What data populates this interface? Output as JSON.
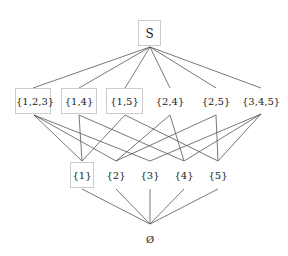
{
  "diagram": {
    "type": "hasse-diagram",
    "colors": {
      "edge": "#555555",
      "box_border": "#cccccc",
      "text": "#222222",
      "background": "#ffffff"
    },
    "top": {
      "id": "S",
      "label": "S",
      "boxed": true
    },
    "bottom": {
      "id": "empty",
      "label": "Ø",
      "boxed": false
    },
    "middle": [
      {
        "id": "123",
        "label": "{1,2,3}",
        "boxed": true
      },
      {
        "id": "14",
        "label": "{1,4}",
        "boxed": true
      },
      {
        "id": "15",
        "label": "{1,5}",
        "boxed": true
      },
      {
        "id": "24",
        "label": "{2,4}",
        "boxed": false
      },
      {
        "id": "25",
        "label": "{2,5}",
        "boxed": false
      },
      {
        "id": "345",
        "label": "{3,4,5}",
        "boxed": false
      }
    ],
    "singletons": [
      {
        "id": "1",
        "label": "{1}",
        "boxed": true
      },
      {
        "id": "2",
        "label": "{2}",
        "boxed": false
      },
      {
        "id": "3",
        "label": "{3}",
        "boxed": false
      },
      {
        "id": "4",
        "label": "{4}",
        "boxed": false
      },
      {
        "id": "5",
        "label": "{5}",
        "boxed": false
      }
    ],
    "edges": [
      [
        "S",
        "123"
      ],
      [
        "S",
        "14"
      ],
      [
        "S",
        "15"
      ],
      [
        "S",
        "24"
      ],
      [
        "S",
        "25"
      ],
      [
        "S",
        "345"
      ],
      [
        "123",
        "1"
      ],
      [
        "123",
        "2"
      ],
      [
        "123",
        "3"
      ],
      [
        "14",
        "1"
      ],
      [
        "14",
        "4"
      ],
      [
        "15",
        "1"
      ],
      [
        "15",
        "5"
      ],
      [
        "24",
        "2"
      ],
      [
        "24",
        "4"
      ],
      [
        "25",
        "2"
      ],
      [
        "25",
        "5"
      ],
      [
        "345",
        "3"
      ],
      [
        "345",
        "4"
      ],
      [
        "345",
        "5"
      ],
      [
        "1",
        "empty"
      ],
      [
        "2",
        "empty"
      ],
      [
        "3",
        "empty"
      ],
      [
        "4",
        "empty"
      ],
      [
        "5",
        "empty"
      ]
    ]
  }
}
